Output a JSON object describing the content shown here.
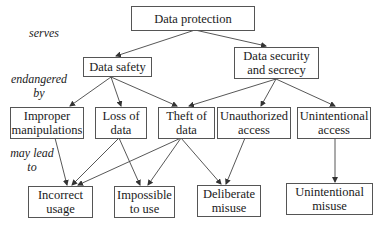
{
  "diagram": {
    "nodes": {
      "data_protection": "Data protection",
      "data_safety": "Data safety",
      "data_security": "Data security\nand secrecy",
      "improper_manipulations": "Improper\nmanipulations",
      "loss_of_data": "Loss of\ndata",
      "theft_of_data": "Theft of\ndata",
      "unauthorized_access": "Unauthorized\naccess",
      "unintentional_access": "Unintentional\naccess",
      "incorrect_usage": "Incorrect\nusage",
      "impossible_to_use": "Impossible\nto use",
      "deliberate_misuse": "Deliberate\nmisuse",
      "unintentional_misuse": "Unintentional\nmisuse"
    },
    "labels": {
      "serves": "serves",
      "endangered_by": "endangered\nby",
      "may_lead_to": "may lead\nto"
    },
    "edges": [
      {
        "from": "Data protection",
        "to": "Data safety"
      },
      {
        "from": "Data protection",
        "to": "Data security and secrecy"
      },
      {
        "from": "Data safety",
        "to": "Improper manipulations"
      },
      {
        "from": "Data safety",
        "to": "Loss of data"
      },
      {
        "from": "Data safety",
        "to": "Theft of data"
      },
      {
        "from": "Data security and secrecy",
        "to": "Theft of data"
      },
      {
        "from": "Data security and secrecy",
        "to": "Unauthorized access"
      },
      {
        "from": "Data security and secrecy",
        "to": "Unintentional access"
      },
      {
        "from": "Improper manipulations",
        "to": "Incorrect usage"
      },
      {
        "from": "Loss of data",
        "to": "Incorrect usage"
      },
      {
        "from": "Loss of data",
        "to": "Impossible to use"
      },
      {
        "from": "Theft of data",
        "to": "Incorrect usage"
      },
      {
        "from": "Theft of data",
        "to": "Impossible to use"
      },
      {
        "from": "Theft of data",
        "to": "Deliberate misuse"
      },
      {
        "from": "Unauthorized access",
        "to": "Deliberate misuse"
      },
      {
        "from": "Unintentional access",
        "to": "Unintentional misuse"
      }
    ]
  }
}
